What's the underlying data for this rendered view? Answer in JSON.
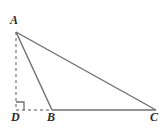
{
  "figure": {
    "background_color": "#ffffff",
    "stroke_color": "#6e6e6e",
    "label_color": "#2b2b2b",
    "width": 166,
    "height": 130
  },
  "labels": {
    "a": "A",
    "b": "B",
    "c": "C",
    "d": "D"
  },
  "points": {
    "A": {
      "x": 16,
      "y": 32
    },
    "B": {
      "x": 52,
      "y": 110
    },
    "C": {
      "x": 156,
      "y": 110
    },
    "D": {
      "x": 16,
      "y": 110
    }
  },
  "segments": [
    {
      "name": "AB",
      "from": "A",
      "to": "B",
      "style": "solid"
    },
    {
      "name": "AC",
      "from": "A",
      "to": "C",
      "style": "solid"
    },
    {
      "name": "BC",
      "from": "B",
      "to": "C",
      "style": "solid"
    },
    {
      "name": "AD",
      "from": "A",
      "to": "D",
      "style": "dashed"
    },
    {
      "name": "DB",
      "from": "D",
      "to": "B",
      "style": "dashed"
    }
  ],
  "right_angle": {
    "at": "D",
    "marker": "square",
    "size": 8
  }
}
